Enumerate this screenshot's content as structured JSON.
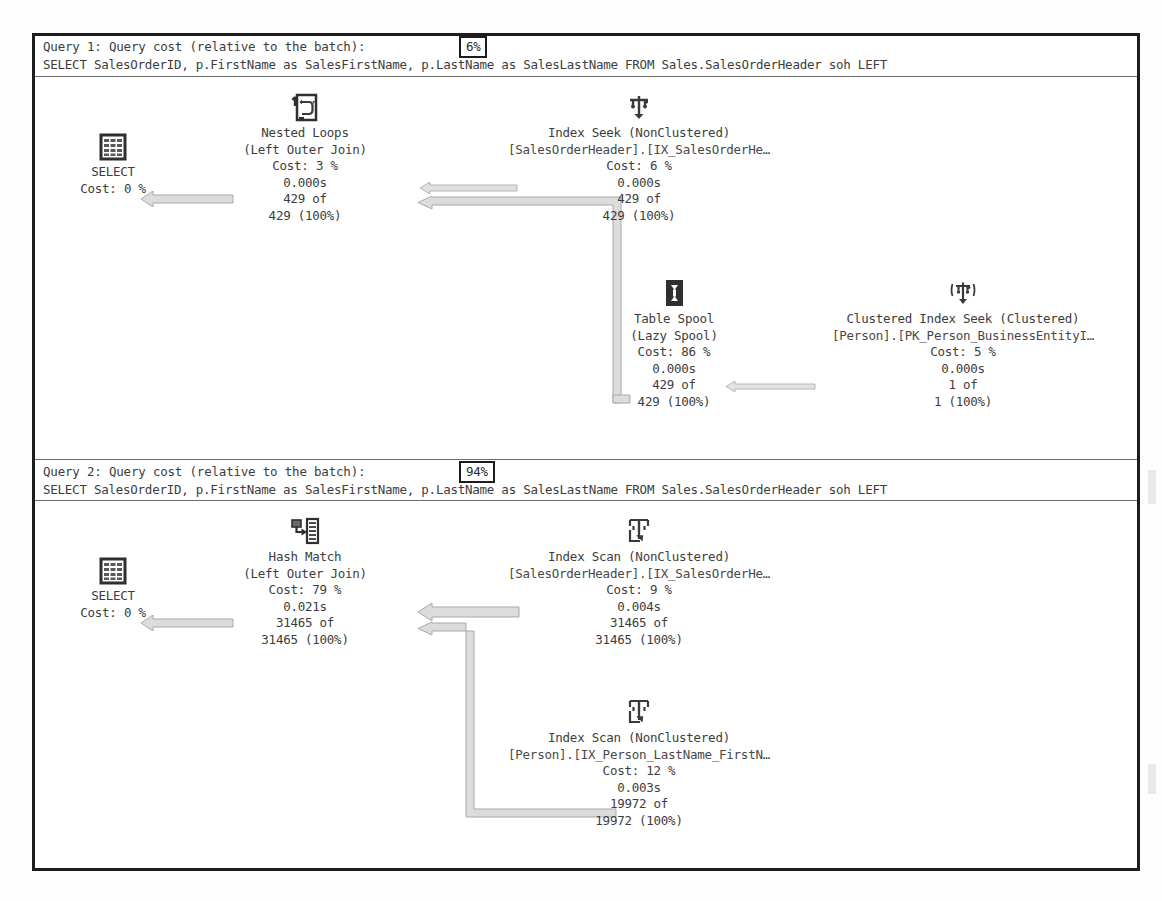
{
  "window": {
    "title": "SQL Server Execution Plan"
  },
  "colors": {
    "frame_border": "#1d1d1d",
    "text": "#3d3d3d",
    "arrow_fill": "#d9d9d9",
    "arrow_stroke": "#a8a8a8",
    "icon_dark": "#2f2f2f",
    "background": "#ffffff"
  },
  "plans": [
    {
      "header": {
        "title": "Query 1: Query cost (relative to the batch):",
        "cost": "6%",
        "sql": "SELECT SalesOrderID, p.FirstName as SalesFirstName, p.LastName as SalesLastName FROM Sales.SalesOrderHeader soh LEFT"
      },
      "nodes": [
        {
          "id": "select-1",
          "icon": "select-result-icon",
          "lines": [
            "SELECT",
            "Cost: 0 %"
          ]
        },
        {
          "id": "nested-loops-1",
          "icon": "nested-loops-icon",
          "lines": [
            "Nested Loops",
            "(Left Outer Join)",
            "Cost: 3 %",
            "0.000s",
            "429 of",
            "429 (100%)"
          ]
        },
        {
          "id": "index-seek-1",
          "icon": "index-seek-icon",
          "lines": [
            "Index Seek (NonClustered)",
            "[SalesOrderHeader].[IX_SalesOrderHe…",
            "Cost: 6 %",
            "0.000s",
            "429 of",
            "429 (100%)"
          ]
        },
        {
          "id": "table-spool-1",
          "icon": "table-spool-icon",
          "lines": [
            "Table Spool",
            "(Lazy Spool)",
            "Cost: 86 %",
            "0.000s",
            "429 of",
            "429 (100%)"
          ]
        },
        {
          "id": "clustered-index-seek-1",
          "icon": "clustered-index-seek-icon",
          "lines": [
            "Clustered Index Seek (Clustered)",
            "[Person].[PK_Person_BusinessEntityI…",
            "Cost: 5 %",
            "0.000s",
            "1 of",
            "1 (100%)"
          ]
        }
      ]
    },
    {
      "header": {
        "title": "Query 2: Query cost (relative to the batch):",
        "cost": "94%",
        "sql": "SELECT SalesOrderID, p.FirstName as SalesFirstName, p.LastName as SalesLastName FROM Sales.SalesOrderHeader soh LEFT"
      },
      "nodes": [
        {
          "id": "select-2",
          "icon": "select-result-icon",
          "lines": [
            "SELECT",
            "Cost: 0 %"
          ]
        },
        {
          "id": "hash-match-2",
          "icon": "hash-match-icon",
          "lines": [
            "Hash Match",
            "(Left Outer Join)",
            "Cost: 79 %",
            "0.021s",
            "31465 of",
            "31465 (100%)"
          ]
        },
        {
          "id": "index-scan-soh-2",
          "icon": "index-scan-icon",
          "lines": [
            "Index Scan (NonClustered)",
            "[SalesOrderHeader].[IX_SalesOrderHe…",
            "Cost: 9 %",
            "0.004s",
            "31465 of",
            "31465 (100%)"
          ]
        },
        {
          "id": "index-scan-person-2",
          "icon": "index-scan-icon",
          "lines": [
            "Index Scan (NonClustered)",
            "[Person].[IX_Person_LastName_FirstN…",
            "Cost: 12 %",
            "0.003s",
            "19972 of",
            "19972 (100%)"
          ]
        }
      ]
    }
  ]
}
